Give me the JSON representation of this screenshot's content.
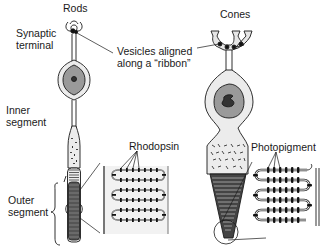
{
  "columns": {
    "rods": "Rods",
    "cones": "Cones"
  },
  "labels": {
    "synaptic_terminal_line1": "Synaptic",
    "synaptic_terminal_line2": "terminal",
    "vesicles_line1": "Vesicles aligned",
    "vesicles_line2": "along a “ribbon”",
    "inner_segment_line1": "Inner",
    "inner_segment_line2": "segment",
    "outer_segment_line1": "Outer",
    "outer_segment_line2": "segment",
    "rhodopsin": "Rhodopsin",
    "photopigment": "Photopigment"
  },
  "colors": {
    "outline": "#1a1a1a",
    "cell_fill": "#ececec",
    "nucleus_outer": "#9a9a9a",
    "nucleus_inner": "#333333",
    "disc_dark": "#3a3a3a",
    "inset_bg": "#f2f2f2"
  }
}
